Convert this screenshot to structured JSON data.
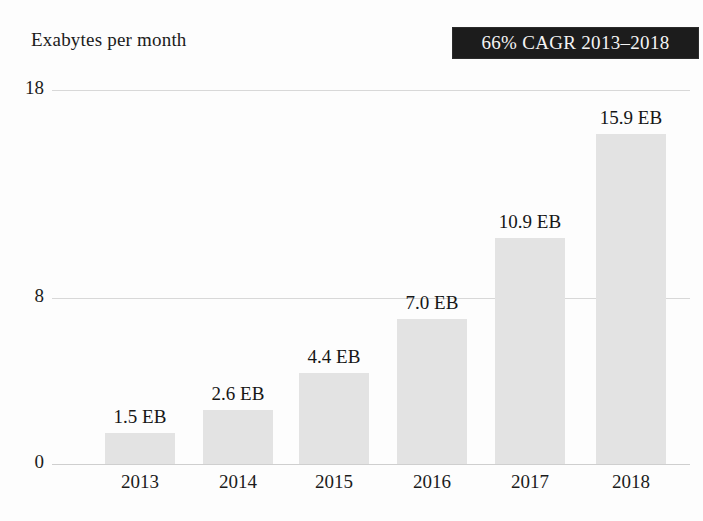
{
  "chart_data": {
    "type": "bar",
    "title": "Exabytes per month",
    "xlabel": "",
    "ylabel": "Exabytes per month",
    "categories": [
      "2013",
      "2014",
      "2015",
      "2016",
      "2017",
      "2018"
    ],
    "values": [
      1.5,
      2.6,
      4.4,
      7.0,
      10.9,
      15.9
    ],
    "value_labels": [
      "1.5 EB",
      "2.6 EB",
      "4.4 EB",
      "7.0 EB",
      "10.9 EB",
      "15.9 EB"
    ],
    "unit": "EB",
    "ylim": [
      0,
      18
    ],
    "yticks": [
      0,
      8,
      18
    ],
    "ytick_labels": [
      "0",
      "8",
      "18"
    ],
    "grid": true,
    "legend": null,
    "annotations": [
      {
        "id": "cagr-badge",
        "text": "66% CAGR 2013–2018",
        "position": "top-right"
      }
    ],
    "colors": {
      "bar_fill": "#e3e3e3",
      "text": "#1b1b1b",
      "gridline": "#d8d8d8",
      "background": "#fdfdfd",
      "badge_background": "#1c1c1c",
      "badge_text": "#f4f4f4"
    }
  },
  "layout": {
    "plot_left": 52,
    "plot_right": 690,
    "baseline_y": 464,
    "top_gridline_y": 90,
    "mid_gridline_y": 255,
    "bar_width": 70,
    "bar_centers": [
      140,
      238,
      334,
      432,
      530,
      631
    ]
  }
}
